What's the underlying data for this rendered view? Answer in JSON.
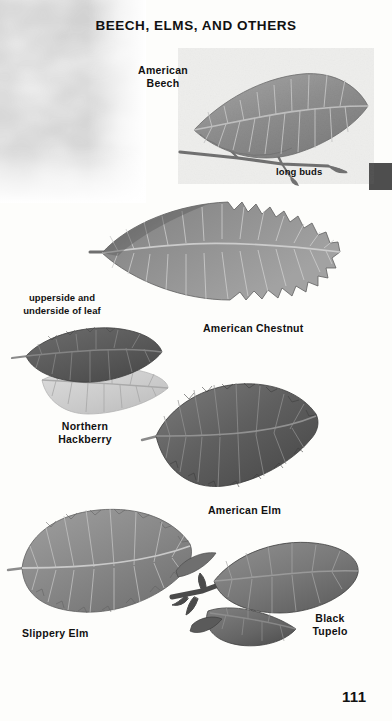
{
  "page": {
    "title": "BEECH, ELMS, AND OTHERS",
    "page_number": "111"
  },
  "specimens": [
    {
      "id": "american-beech",
      "label": "American\nBeech",
      "annotation": "long buds"
    },
    {
      "id": "american-chestnut",
      "label": "American Chestnut"
    },
    {
      "id": "northern-hackberry",
      "label": "Northern\nHackberry",
      "annotation": "upperside and\nunderside of leaf"
    },
    {
      "id": "american-elm",
      "label": "American Elm"
    },
    {
      "id": "slippery-elm",
      "label": "Slippery Elm"
    },
    {
      "id": "black-tupelo",
      "label": "Black\nTupelo"
    }
  ],
  "labels": {
    "beech": "American\nBeech",
    "long_buds": "long buds",
    "chestnut": "American Chestnut",
    "upperside_underside": "upperside and\nunderside of leaf",
    "hackberry": "Northern\nHackberry",
    "american_elm": "American Elm",
    "slippery_elm": "Slippery Elm",
    "black_tupelo": "Black\nTupelo"
  },
  "colors": {
    "ink": "#111111",
    "paper": "#fdfdfb",
    "edge_tab": "#4e4e4e",
    "leaf_mid": "#8d8d8d",
    "leaf_dark": "#5d5d5d",
    "leaf_light": "#c9c9c9"
  }
}
